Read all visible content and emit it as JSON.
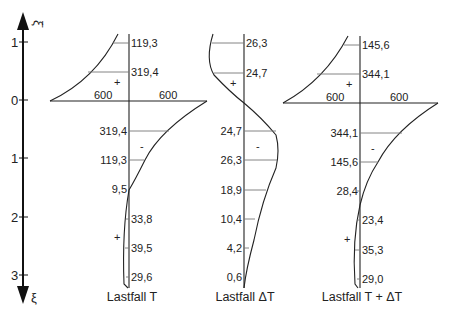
{
  "axis": {
    "label_top": "ξ̄",
    "label_bottom": "ξ",
    "ticks": [
      {
        "label": "1",
        "y": 42
      },
      {
        "label": "0",
        "y": 100
      },
      {
        "label": "1",
        "y": 158
      },
      {
        "label": "2",
        "y": 217
      },
      {
        "label": "3",
        "y": 275
      }
    ]
  },
  "panels": [
    {
      "caption": "Lastfall T",
      "baseline_left": "600",
      "baseline_right": "600",
      "sign_upper": "+",
      "sign_middle": "-",
      "sign_lower": "+",
      "upper_values": [
        "119,3",
        "319,4"
      ],
      "lower_values": [
        "319,4",
        "119,3",
        "9,5",
        "33,8",
        "39,5",
        "29,6"
      ]
    },
    {
      "caption": "Lastfall ΔT",
      "sign_upper": "+",
      "sign_middle": "-",
      "upper_values": [
        "26,3",
        "24,7"
      ],
      "lower_values": [
        "24,7",
        "26,3",
        "18,9",
        "10,4",
        "4,2",
        "0,6"
      ]
    },
    {
      "caption": "Lastfall T + ΔT",
      "baseline_left": "600",
      "baseline_right": "600",
      "sign_upper": "+",
      "sign_middle": "-",
      "sign_lower": "+",
      "upper_values": [
        "145,6",
        "344,1"
      ],
      "lower_values": [
        "344,1",
        "145,6",
        "28,4",
        "23,4",
        "35,3",
        "29,0"
      ]
    }
  ]
}
